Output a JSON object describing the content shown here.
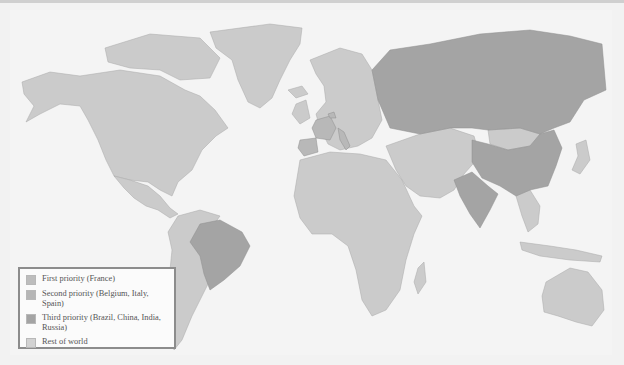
{
  "map": {
    "type": "choropleth world map",
    "colors": {
      "ocean": "#f4f4f4",
      "first_priority": "#bdbdbd",
      "second_priority": "#b6b6b6",
      "third_priority": "#a4a4a4",
      "rest_of_world": "#cbcbcb",
      "border": "#9a9a9a"
    },
    "highlighted": {
      "first_priority": [
        "France"
      ],
      "second_priority": [
        "Belgium",
        "Italy",
        "Spain"
      ],
      "third_priority": [
        "Brazil",
        "China",
        "India",
        "Russia"
      ]
    }
  },
  "legend": {
    "items": [
      {
        "label": "First priority (France)",
        "color": "#bdbdbd"
      },
      {
        "label": "Second priority (Belgium, Italy, Spain)",
        "color": "#b6b6b6"
      },
      {
        "label": "Third priority (Brazil, China, India, Russia)",
        "color": "#a4a4a4"
      },
      {
        "label": "Rest of world",
        "color": "#d2d2d2"
      }
    ]
  }
}
